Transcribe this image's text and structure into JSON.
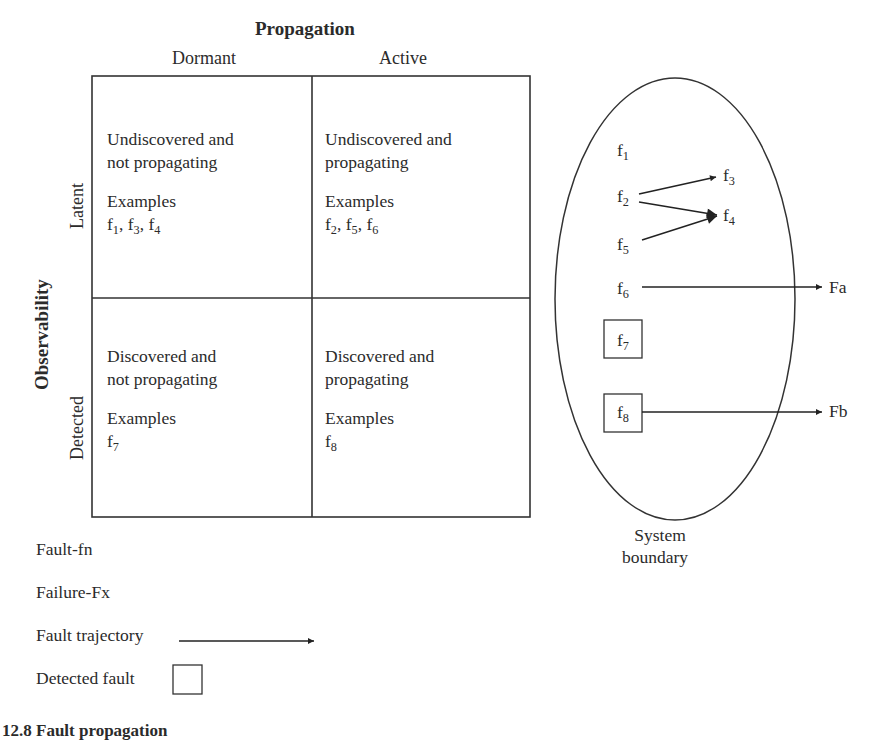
{
  "matrix": {
    "column_axis_title": "Propagation",
    "columns": [
      "Dormant",
      "Active"
    ],
    "row_axis_title": "Observability",
    "rows": [
      "Latent",
      "Detected"
    ],
    "cells": [
      {
        "row": "Latent",
        "col": "Dormant",
        "line1": "Undiscovered and",
        "line2": "not propagating",
        "examples_label": "Examples",
        "examples": [
          {
            "base": "f",
            "sub": "1"
          },
          {
            "base": "f",
            "sub": "3"
          },
          {
            "base": "f",
            "sub": "4"
          }
        ]
      },
      {
        "row": "Latent",
        "col": "Active",
        "line1": "Undiscovered and",
        "line2": "propagating",
        "examples_label": "Examples",
        "examples": [
          {
            "base": "f",
            "sub": "2"
          },
          {
            "base": "f",
            "sub": "5"
          },
          {
            "base": "f",
            "sub": "6"
          }
        ]
      },
      {
        "row": "Detected",
        "col": "Dormant",
        "line1": "Discovered and",
        "line2": "not propagating",
        "examples_label": "Examples",
        "examples": [
          {
            "base": "f",
            "sub": "7"
          }
        ]
      },
      {
        "row": "Detected",
        "col": "Active",
        "line1": "Discovered and",
        "line2": "propagating",
        "examples_label": "Examples",
        "examples": [
          {
            "base": "f",
            "sub": "8"
          }
        ]
      }
    ]
  },
  "system": {
    "boundary_label_line1": "System",
    "boundary_label_line2": "boundary",
    "faults": [
      {
        "id": "f1",
        "base": "f",
        "sub": "1",
        "detected": false
      },
      {
        "id": "f2",
        "base": "f",
        "sub": "2",
        "detected": false
      },
      {
        "id": "f3",
        "base": "f",
        "sub": "3",
        "detected": false
      },
      {
        "id": "f4",
        "base": "f",
        "sub": "4",
        "detected": false
      },
      {
        "id": "f5",
        "base": "f",
        "sub": "5",
        "detected": false
      },
      {
        "id": "f6",
        "base": "f",
        "sub": "6",
        "detected": false
      },
      {
        "id": "f7",
        "base": "f",
        "sub": "7",
        "detected": true
      },
      {
        "id": "f8",
        "base": "f",
        "sub": "8",
        "detected": true
      }
    ],
    "failures": [
      {
        "id": "Fa",
        "label": "Fa"
      },
      {
        "id": "Fb",
        "label": "Fb"
      }
    ],
    "trajectories": [
      {
        "from": "f2",
        "to": "f3"
      },
      {
        "from": "f2",
        "to": "f4"
      },
      {
        "from": "f5",
        "to": "f4"
      },
      {
        "from": "f6",
        "to": "Fa"
      },
      {
        "from": "f8",
        "to": "Fb"
      }
    ]
  },
  "legend": {
    "fault": "Fault-fn",
    "failure": "Failure-Fx",
    "trajectory": "Fault trajectory",
    "detected": "Detected fault"
  },
  "caption": "12.8   Fault propagation"
}
